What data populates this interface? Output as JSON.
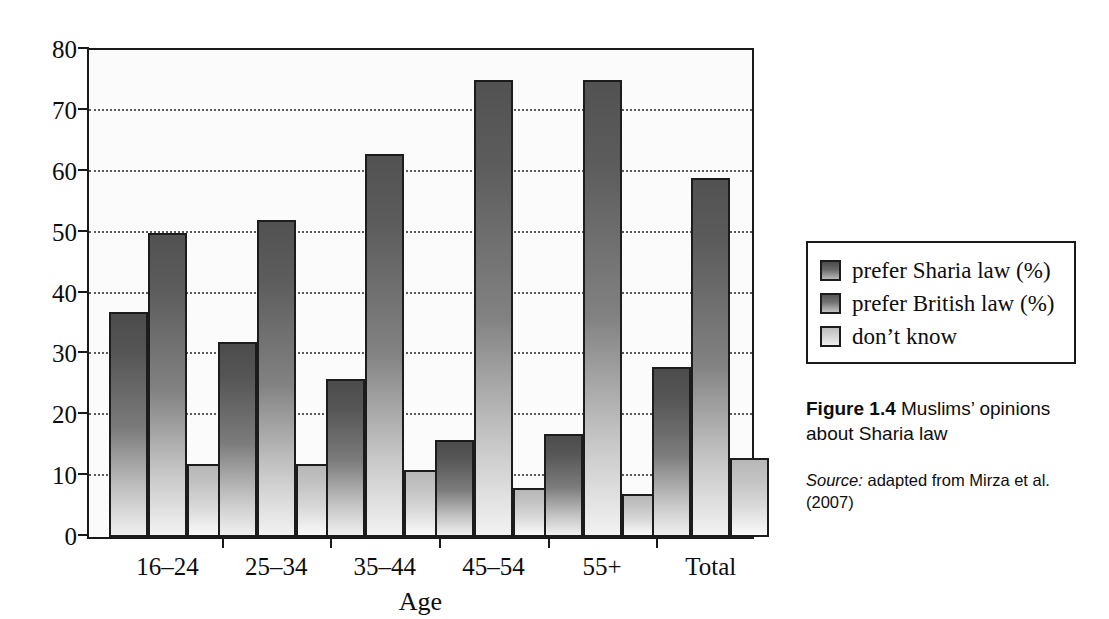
{
  "chart_data": {
    "type": "bar",
    "xlabel": "Age",
    "ylabel": "",
    "ylim": [
      0,
      80
    ],
    "ytick_step": 10,
    "yticks": [
      "0",
      "10",
      "20",
      "30",
      "40",
      "50",
      "60",
      "70",
      "80"
    ],
    "grid": true,
    "legend_position": "right",
    "categories": [
      "16–24",
      "25–34",
      "35–44",
      "45–54",
      "55+",
      "Total"
    ],
    "series": [
      {
        "name": "prefer Sharia law (%)",
        "key": "sharia",
        "values": [
          37,
          32,
          26,
          16,
          17,
          28
        ]
      },
      {
        "name": "prefer British law (%)",
        "key": "british",
        "values": [
          50,
          52,
          63,
          75,
          75,
          59
        ]
      },
      {
        "name": "don't know",
        "key": "dontknow",
        "values": [
          12,
          12,
          11,
          8,
          7,
          13
        ]
      }
    ]
  },
  "legend": {
    "items": [
      {
        "label": "prefer Sharia law (%)",
        "swatch": "sharia"
      },
      {
        "label": "prefer British law (%)",
        "swatch": "british"
      },
      {
        "label": "don’t know",
        "swatch": "dontknow"
      }
    ]
  },
  "caption": {
    "figure_number": "Figure 1.4",
    "figure_text": " Muslims’ opinions about Sharia law",
    "source_word": "Source:",
    "source_text": " adapted from Mirza et al. (2007)"
  },
  "axis": {
    "x_title": "Age"
  }
}
